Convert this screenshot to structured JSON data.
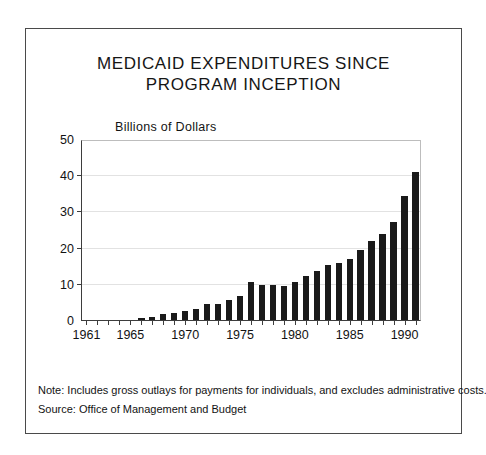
{
  "figure": {
    "title_lines": [
      "MEDICAID EXPENDITURES SINCE",
      "PROGRAM INCEPTION"
    ],
    "notes": [
      "Note:  Includes gross outlays for payments for individuals, and excludes administrative costs.",
      "Source:  Office of Management and Budget"
    ],
    "border_color": "#4a4a4a",
    "bar_color": "#1a1a1a"
  },
  "chart_data": {
    "type": "bar",
    "title": "MEDICAID EXPENDITURES SINCE PROGRAM INCEPTION",
    "subtitle": "",
    "xlabel": "",
    "ylabel": "Billions of Dollars",
    "ylim": [
      0,
      50
    ],
    "yticks": [
      0,
      10,
      20,
      30,
      40,
      50
    ],
    "ytick_labels": [
      "0",
      "10",
      "20",
      "30",
      "40",
      "50"
    ],
    "grid": true,
    "legend": "none",
    "xtick_labels": [
      "1961",
      "1965",
      "1970",
      "1975",
      "1980",
      "1985",
      "1990"
    ],
    "categories": [
      "1961",
      "1962",
      "1963",
      "1964",
      "1965",
      "1966",
      "1967",
      "1968",
      "1969",
      "1970",
      "1971",
      "1972",
      "1973",
      "1974",
      "1975",
      "1976",
      "1977",
      "1978",
      "1979",
      "1980",
      "1981",
      "1982",
      "1983",
      "1984",
      "1985",
      "1986",
      "1987",
      "1988",
      "1989",
      "1990"
    ],
    "values": [
      0.1,
      0.2,
      0.2,
      0.3,
      0.3,
      0.8,
      1.2,
      1.8,
      2.3,
      2.7,
      3.4,
      4.6,
      4.6,
      5.8,
      6.8,
      10.7,
      9.9,
      10.0,
      9.7,
      10.7,
      12.3,
      13.7,
      15.4,
      16.1,
      17.1,
      19.5,
      22.1,
      24.0,
      27.4,
      34.6
    ],
    "last_value": 41.1,
    "note": "Final 1990 bar reaches approximately 41 billion dollars"
  }
}
